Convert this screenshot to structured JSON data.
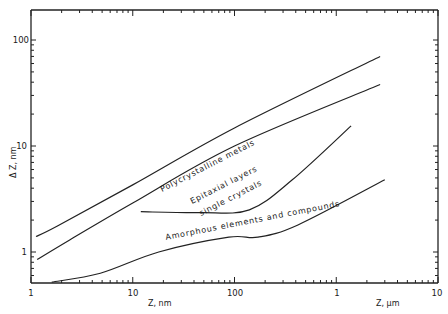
{
  "chart_data": {
    "type": "line",
    "title": "",
    "xlabel_left": "Z, nm",
    "xlabel_right": "Z, µm",
    "ylabel": "Δ Z, nm",
    "xscale": "log",
    "yscale": "log",
    "xlim_nm": [
      1,
      10000
    ],
    "ylim_nm": [
      0.5,
      130
    ],
    "x_tick_labels": [
      "1",
      "10",
      "100",
      "1",
      "10"
    ],
    "x_tick_values_nm": [
      1,
      10,
      100,
      1000,
      10000
    ],
    "y_tick_labels": [
      "1",
      "10",
      "100"
    ],
    "y_tick_values": [
      1,
      10,
      100
    ],
    "grid": false,
    "legend": "none (inline labels)",
    "series": [
      {
        "name": "Polycrystalline metals",
        "x_nm": [
          1.12,
          1.8,
          10,
          100,
          2700
        ],
        "y_nm": [
          1.4,
          1.75,
          4.3,
          14.8,
          70
        ]
      },
      {
        "name": "Epitaxial layers single crystals (upper bound)",
        "x_nm": [
          1.15,
          2.4,
          10,
          100,
          2700
        ],
        "y_nm": [
          0.85,
          1.3,
          2.9,
          10,
          38
        ]
      },
      {
        "name": "Epitaxial layers single crystals (lower bound)",
        "x_nm": [
          12,
          46,
          140,
          370,
          1400
        ],
        "y_nm": [
          2.4,
          2.35,
          2.5,
          4.8,
          15.5
        ]
      },
      {
        "name": "Amorphous elements and compounds",
        "x_nm": [
          1.6,
          4.8,
          18,
          88,
          170,
          420,
          3000
        ],
        "y_nm": [
          0.52,
          0.63,
          1.0,
          1.38,
          1.38,
          1.8,
          4.8
        ]
      }
    ],
    "annotations": [
      "Polycrystalline metals",
      "Epitaxial layers",
      "single crystals",
      "Amorphous elements and compounds"
    ]
  }
}
